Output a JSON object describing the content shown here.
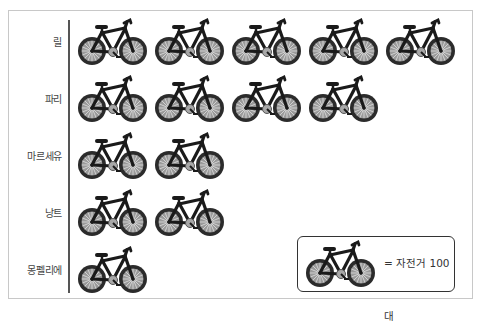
{
  "chart_data": {
    "type": "pictograph",
    "title": "",
    "unit_icon": "bicycle-icon",
    "unit_value": 100,
    "unit_label": "자전거",
    "categories": [
      "릴",
      "파리",
      "마르세유",
      "낭트",
      "몽펠리에"
    ],
    "icon_counts": [
      5,
      4,
      2,
      2,
      1
    ],
    "values": [
      500,
      400,
      200,
      200,
      100
    ],
    "legend_position": "bottom-right"
  },
  "rows": [
    {
      "label": "릴",
      "count": 5
    },
    {
      "label": "파리",
      "count": 4
    },
    {
      "label": "마르세유",
      "count": 2
    },
    {
      "label": "낭트",
      "count": 2
    },
    {
      "label": "몽펠리에",
      "count": 1
    }
  ],
  "legend": {
    "text": "= 자전거 100대"
  },
  "colors": {
    "frame_border": "#c8c8c8",
    "axis": "#555555",
    "bike_frame": "#1a1a1a",
    "tire": "#2b2b2b",
    "rim": "#9a9a9a",
    "spokes": "#d8d8d8"
  }
}
